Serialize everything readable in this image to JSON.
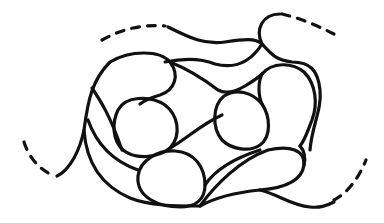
{
  "image": {
    "description": "Black-ink line drawing of an interlocking loop / pebble quilting motif with dashed continuation lines",
    "stroke_color": "#111111",
    "background_color": "#ffffff"
  }
}
